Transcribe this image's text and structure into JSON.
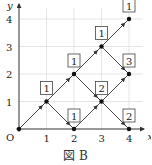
{
  "diagram": {
    "caption": "図 B",
    "axes": {
      "x_label": "x",
      "y_label": "y",
      "origin_label": "O",
      "x_ticks": [
        "1",
        "2",
        "3",
        "4"
      ],
      "y_ticks": [
        "1",
        "2",
        "3",
        "4"
      ]
    },
    "points": [
      {
        "x": 0,
        "y": 0,
        "label": ""
      },
      {
        "x": 1,
        "y": 1,
        "label": "1"
      },
      {
        "x": 2,
        "y": 0,
        "label": "1"
      },
      {
        "x": 2,
        "y": 2,
        "label": "1"
      },
      {
        "x": 3,
        "y": 1,
        "label": "2"
      },
      {
        "x": 3,
        "y": 3,
        "label": "1"
      },
      {
        "x": 4,
        "y": 0,
        "label": "2"
      },
      {
        "x": 4,
        "y": 2,
        "label": "3"
      },
      {
        "x": 4,
        "y": 4,
        "label": "1"
      }
    ],
    "edges": [
      [
        [
          0,
          0
        ],
        [
          1,
          1
        ]
      ],
      [
        [
          1,
          1
        ],
        [
          2,
          0
        ]
      ],
      [
        [
          1,
          1
        ],
        [
          2,
          2
        ]
      ],
      [
        [
          2,
          0
        ],
        [
          3,
          1
        ]
      ],
      [
        [
          2,
          2
        ],
        [
          3,
          1
        ]
      ],
      [
        [
          2,
          2
        ],
        [
          3,
          3
        ]
      ],
      [
        [
          3,
          1
        ],
        [
          4,
          0
        ]
      ],
      [
        [
          3,
          1
        ],
        [
          4,
          2
        ]
      ],
      [
        [
          3,
          3
        ],
        [
          4,
          2
        ]
      ],
      [
        [
          3,
          3
        ],
        [
          4,
          4
        ]
      ]
    ],
    "colors": {
      "line": "#333333",
      "grid": "#dddddd",
      "box_border": "#444444"
    }
  }
}
